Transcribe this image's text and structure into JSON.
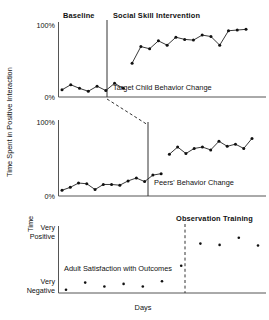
{
  "figure": {
    "y_axis_label": "Time Spent in Positive Interaction",
    "x_axis_label": "Days",
    "panel3_y_axis_label": "Time"
  },
  "chart_data": [
    {
      "type": "line",
      "panel": 1,
      "title": "Target Child Behavior Change",
      "phase_labels": [
        "Baseline",
        "Social Skill Intervention"
      ],
      "ylabel": "Time Spent in Positive Interaction",
      "xlabel": "Days",
      "ytick_labels": [
        "0%",
        "100%"
      ],
      "ylim": [
        0,
        100
      ],
      "grid": false,
      "legend": "none",
      "phase_line_x": 8.5,
      "series": [
        {
          "name": "Baseline",
          "x": [
            1,
            2,
            3,
            4,
            5,
            6,
            7,
            8
          ],
          "values": [
            10,
            17,
            12,
            8,
            15,
            9,
            19,
            12
          ]
        },
        {
          "name": "Social Skill Intervention",
          "x": [
            9,
            10,
            11,
            12,
            13,
            14,
            15,
            16,
            17,
            18,
            19,
            20,
            21,
            22
          ],
          "values": [
            47,
            70,
            67,
            78,
            72,
            83,
            80,
            79,
            86,
            84,
            72,
            92,
            93,
            94
          ]
        }
      ]
    },
    {
      "type": "line",
      "panel": 2,
      "title": "Peers' Behavior Change",
      "phase_labels": [],
      "ylabel": "Time Spent in Positive Interaction",
      "xlabel": "Days",
      "ytick_labels": [
        "0%",
        "100%"
      ],
      "ylim": [
        0,
        100
      ],
      "grid": false,
      "legend": "none",
      "phase_line_x": 13.5,
      "series": [
        {
          "name": "Baseline",
          "x": [
            1,
            2,
            3,
            4,
            5,
            6,
            7,
            8,
            9,
            10,
            11,
            12,
            13
          ],
          "values": [
            8,
            12,
            18,
            17,
            9,
            16,
            16,
            15,
            21,
            25,
            20,
            29,
            31
          ]
        },
        {
          "name": "Social Skill Intervention",
          "x": [
            14,
            15,
            16,
            17,
            18,
            19,
            20,
            21,
            22,
            23,
            24
          ],
          "values": [
            58,
            68,
            59,
            66,
            68,
            64,
            76,
            69,
            72,
            66,
            80
          ]
        }
      ]
    },
    {
      "type": "scatter",
      "panel": 3,
      "title": "Adult Satisfaction with Outcomes",
      "phase_labels": [
        "Observation Training"
      ],
      "ylabel": "Time",
      "xlabel": "Days",
      "ytick_labels": [
        "Very Negative",
        "Very Positive"
      ],
      "ylim": [
        0,
        100
      ],
      "grid": false,
      "legend": "none",
      "phase_line_x": 6.5,
      "phase_line_style": "dashed",
      "series": [
        {
          "name": "Before Observation Training",
          "x": [
            1,
            2,
            3,
            4,
            5,
            6
          ],
          "values": [
            5,
            16,
            10,
            14,
            10,
            18
          ]
        },
        {
          "name": "After Observation Training",
          "x": [
            7,
            8,
            9,
            10,
            11
          ],
          "values": [
            42,
            76,
            74,
            85,
            73
          ]
        }
      ]
    }
  ]
}
